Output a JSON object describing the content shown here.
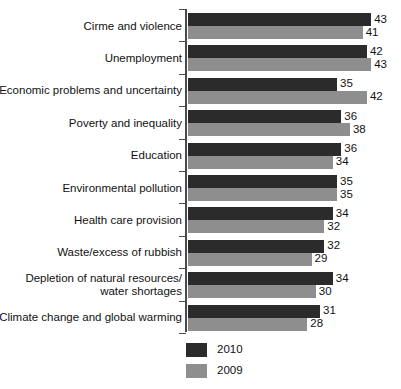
{
  "chart_data": {
    "type": "bar",
    "orientation": "horizontal",
    "title": "",
    "subtitle": "",
    "xlabel": "",
    "ylabel": "",
    "grid": false,
    "legend_position": "bottom-left",
    "xlim": [
      0,
      43
    ],
    "categories": [
      "Cirme and violence",
      "Unemployment",
      "Economic problems and uncertainty",
      "Poverty and inequality",
      "Education",
      "Environmental pollution",
      "Health care provision",
      "Waste/excess of rubbish",
      "Depletion of natural resources/\nwater shortages",
      "Climate change and global warming"
    ],
    "series": [
      {
        "name": "2010",
        "color": "#2b2b2b",
        "values": [
          43,
          42,
          35,
          36,
          36,
          35,
          34,
          32,
          34,
          31
        ]
      },
      {
        "name": "2009",
        "color": "#8e8e8e",
        "values": [
          41,
          43,
          42,
          38,
          34,
          35,
          32,
          29,
          30,
          28
        ]
      }
    ]
  },
  "legend": {
    "items": [
      {
        "label": "2010",
        "color": "#2b2b2b"
      },
      {
        "label": "2009",
        "color": "#8e8e8e"
      }
    ]
  }
}
